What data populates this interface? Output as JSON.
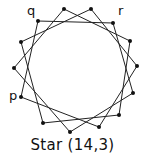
{
  "diagram": {
    "caption": "Star (14,3)",
    "n": 14,
    "step": 3,
    "points": [
      [
        64,
        9
      ],
      [
        91,
        9
      ],
      [
        113,
        23
      ],
      [
        130,
        41
      ],
      [
        137,
        66
      ],
      [
        133,
        93
      ],
      [
        119,
        115
      ],
      [
        99,
        127
      ],
      [
        70,
        132
      ],
      [
        43,
        123
      ],
      [
        21,
        97
      ],
      [
        14,
        68
      ],
      [
        21,
        42
      ],
      [
        38,
        21
      ]
    ],
    "labels": [
      {
        "text": "q",
        "x": 27,
        "y": 14
      },
      {
        "text": "r",
        "x": 118,
        "y": 14
      },
      {
        "text": "p",
        "x": 9,
        "y": 99
      }
    ],
    "stroke_color": "#222222",
    "dot_color": "#111111"
  }
}
